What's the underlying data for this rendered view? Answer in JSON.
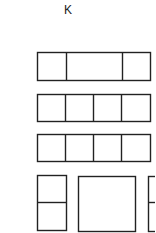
{
  "diagram": {
    "title": "K",
    "stroke_color": "#222222",
    "background": "#ffffff",
    "rows": [
      {
        "name": "row-1",
        "box": {
          "x": 37,
          "y": 52,
          "w": 113,
          "h": 28
        },
        "dividers_x": [
          66,
          122
        ]
      },
      {
        "name": "row-2",
        "box": {
          "x": 37,
          "y": 94,
          "w": 113,
          "h": 27
        },
        "dividers_x": [
          65,
          93,
          121
        ]
      },
      {
        "name": "row-3",
        "box": {
          "x": 37,
          "y": 134,
          "w": 113,
          "h": 27
        },
        "dividers_x": [
          65,
          93,
          121
        ]
      }
    ],
    "bottom_shapes": [
      {
        "name": "left-split-box",
        "x": 37,
        "y": 175,
        "w": 29,
        "h": 55,
        "divider_y": 202
      },
      {
        "name": "large-square",
        "x": 78,
        "y": 176,
        "w": 57,
        "h": 55
      },
      {
        "name": "right-split-box-cropped",
        "x": 148,
        "y": 176,
        "w": 20,
        "h": 55,
        "divider_y": 202
      }
    ]
  }
}
